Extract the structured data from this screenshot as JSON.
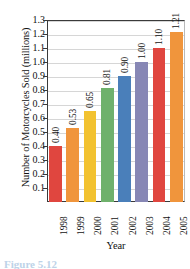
{
  "chart_data": {
    "type": "bar",
    "title": "",
    "xlabel": "Year",
    "ylabel": "Number of Motorcycles Sold (millions)",
    "categories": [
      "1998",
      "1999",
      "2000",
      "2001",
      "2002",
      "2003",
      "2004",
      "2005"
    ],
    "values": [
      0.4,
      0.53,
      0.65,
      0.81,
      0.9,
      1.0,
      1.1,
      1.21
    ],
    "value_labels": [
      "0.40",
      "0.53",
      "0.65",
      "0.81",
      "0.90",
      "1.00",
      "1.10",
      "1.21"
    ],
    "bar_colors": [
      "#e0463f",
      "#f0953c",
      "#f2c230",
      "#6fb16c",
      "#4a7fba",
      "#8787b5",
      "#e0463f",
      "#f0953c"
    ],
    "ylim": [
      0,
      1.3
    ],
    "yticks": [
      0.1,
      0.2,
      0.3,
      0.4,
      0.5,
      0.6,
      0.7,
      0.8,
      0.9,
      1.0,
      1.1,
      1.2,
      1.3
    ],
    "ytick_labels": [
      "0.1",
      "0.2",
      "0.3",
      "0.4",
      "0.5",
      "0.6",
      "0.7",
      "0.8",
      "0.9",
      "1.0",
      "1.1",
      "1.2",
      "1.3"
    ],
    "grid": true,
    "grid_axis": "y",
    "legend": null
  },
  "caption": {
    "text": "Figure 5.12"
  },
  "top_clip": {
    "text": ""
  }
}
